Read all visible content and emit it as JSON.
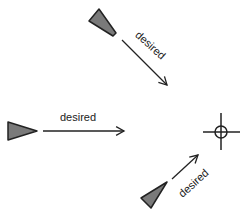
{
  "diagram": {
    "colors": {
      "background": "#ffffff",
      "wedge_fill": "#7a7a7a",
      "stroke": "#222222"
    },
    "agents": [
      {
        "id": "agent-top",
        "shape": "wedge",
        "points": "89,21 99,9 116,33 113,36"
      },
      {
        "id": "agent-left",
        "shape": "wedge",
        "points": "8,122 8,140 37,131"
      },
      {
        "id": "agent-bottom",
        "shape": "wedge",
        "points": "141,198 167,182 151,208"
      }
    ],
    "arrows": [
      {
        "id": "arrow-top",
        "x1": 122,
        "y1": 40,
        "x2": 167,
        "y2": 85,
        "label": "desired",
        "label_x": 148,
        "label_y": 48,
        "label_rotate": 42
      },
      {
        "id": "arrow-left",
        "x1": 43,
        "y1": 131,
        "x2": 124,
        "y2": 131,
        "label": "desired",
        "label_x": 78,
        "label_y": 121,
        "label_rotate": 0
      },
      {
        "id": "arrow-bottom",
        "x1": 172,
        "y1": 179,
        "x2": 198,
        "y2": 155,
        "label": "desired",
        "label_x": 196,
        "label_y": 186,
        "label_rotate": -42
      }
    ],
    "target": {
      "id": "crosshair-target",
      "cx": 221,
      "cy": 132,
      "r": 6,
      "h_x1": 203,
      "h_x2": 240,
      "v_y1": 113,
      "v_y2": 150
    }
  }
}
